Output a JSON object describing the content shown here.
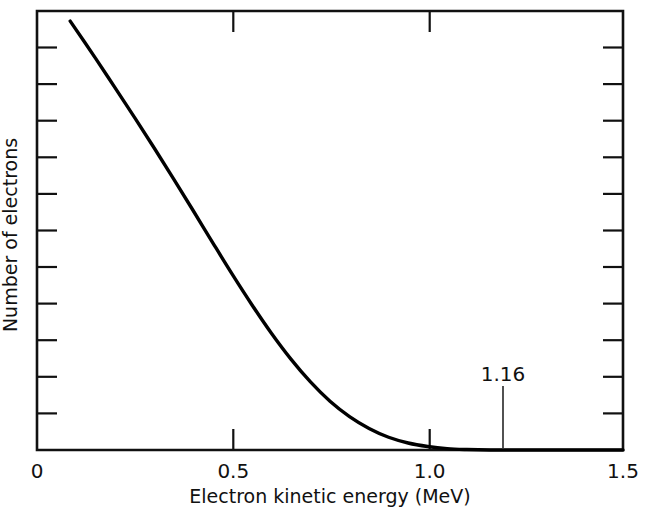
{
  "chart_data": {
    "type": "line",
    "title": "",
    "xlabel": "Electron kinetic energy (MeV)",
    "ylabel": "Number of electrons",
    "xlim": [
      0,
      1.5
    ],
    "ylim": [
      0,
      1
    ],
    "grid": false,
    "legend": null,
    "xticklabels": [
      "0",
      "0.5",
      "1.0",
      "1.5"
    ],
    "xtickvalues": [
      0,
      0.5,
      1.0,
      1.5
    ],
    "yticklabels": [],
    "yminorticks": 11,
    "annotations": [
      {
        "text": "1.16",
        "x": 1.16,
        "y": 0,
        "kind": "endpoint-marker",
        "pointer": true
      }
    ],
    "series": [
      {
        "name": "beta spectrum",
        "color": "#000000",
        "x": [
          0.085,
          0.15,
          0.2,
          0.25,
          0.3,
          0.35,
          0.4,
          0.45,
          0.5,
          0.55,
          0.6,
          0.65,
          0.7,
          0.75,
          0.8,
          0.85,
          0.9,
          0.95,
          1.0,
          1.05,
          1.1,
          1.16,
          1.25,
          1.4,
          1.5
        ],
        "y": [
          0.977,
          0.892,
          0.825,
          0.757,
          0.688,
          0.617,
          0.545,
          0.472,
          0.4,
          0.331,
          0.266,
          0.207,
          0.155,
          0.111,
          0.076,
          0.049,
          0.029,
          0.016,
          0.008,
          0.003,
          0.001,
          0.0,
          0.0,
          0.0,
          0.0
        ]
      }
    ]
  },
  "axes": {
    "x_tick_labels": [
      {
        "value": "0",
        "pos": 0
      },
      {
        "value": "0.5",
        "pos": 0.5
      },
      {
        "value": "1.0",
        "pos": 1.0
      },
      {
        "value": "1.5",
        "pos": 1.5
      }
    ],
    "x_axis_title": "Electron kinetic energy (MeV)",
    "y_axis_title": "Number of electrons"
  },
  "annotation": {
    "endpoint_label": "1.16"
  }
}
